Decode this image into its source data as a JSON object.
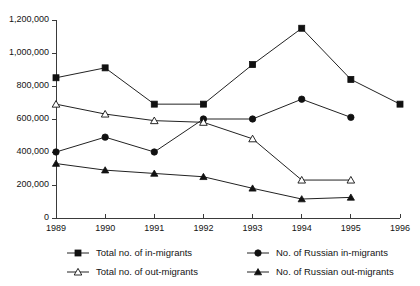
{
  "chart_data": {
    "type": "line",
    "title": "",
    "xlabel": "",
    "ylabel": "",
    "x": [
      1989,
      1990,
      1991,
      1992,
      1993,
      1994,
      1995,
      1996
    ],
    "xtick_labels": [
      "1989",
      "1990",
      "1991",
      "1992",
      "1993",
      "1994",
      "1995",
      "1996"
    ],
    "ytick_labels": [
      "0",
      "200,000",
      "400,000",
      "600,000",
      "800,000",
      "1,000,000",
      "1,200,000"
    ],
    "ytick_values": [
      0,
      200000,
      400000,
      600000,
      800000,
      1000000,
      1200000
    ],
    "ylim": [
      0,
      1200000
    ],
    "xlim": [
      1989,
      1996
    ],
    "grid": false,
    "legend_position": "bottom",
    "series": [
      {
        "name": "Total no. of in-migrants",
        "marker": "filled-square",
        "x": [
          1989,
          1990,
          1991,
          1992,
          1993,
          1994,
          1995,
          1996
        ],
        "values": [
          850000,
          910000,
          690000,
          690000,
          930000,
          1150000,
          840000,
          690000
        ]
      },
      {
        "name": "No. of Russian in-migrants",
        "marker": "filled-circle",
        "x": [
          1989,
          1990,
          1991,
          1992,
          1993,
          1994,
          1995
        ],
        "values": [
          400000,
          490000,
          400000,
          600000,
          600000,
          720000,
          610000
        ]
      },
      {
        "name": "Total no. of out-migrants",
        "marker": "open-triangle",
        "x": [
          1989,
          1990,
          1991,
          1992,
          1993,
          1994,
          1995
        ],
        "values": [
          690000,
          630000,
          590000,
          580000,
          480000,
          230000,
          230000
        ]
      },
      {
        "name": "No. of Russian out-migrants",
        "marker": "filled-triangle",
        "x": [
          1989,
          1990,
          1991,
          1992,
          1993,
          1994,
          1995
        ],
        "values": [
          330000,
          290000,
          270000,
          250000,
          180000,
          115000,
          125000
        ]
      }
    ]
  },
  "legend": {
    "items": [
      {
        "label": "Total no. of in-migrants",
        "marker": "filled-square"
      },
      {
        "label": "No. of Russian in-migrants",
        "marker": "filled-circle"
      },
      {
        "label": "Total no. of out-migrants",
        "marker": "open-triangle"
      },
      {
        "label": "No. of Russian out-migrants",
        "marker": "filled-triangle"
      }
    ]
  },
  "colors": {
    "line": "#222222",
    "axis": "#3a3a3a",
    "text": "#141414",
    "background": "#ffffff"
  }
}
